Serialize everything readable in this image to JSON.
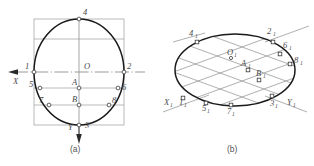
{
  "figure": {
    "colors": {
      "curve": "#1a1a1a",
      "construction": "#9a9a9a",
      "axis": "#7d7d7d",
      "label": "#4a4a4a",
      "background": "#ffffff",
      "marker_fill": "#ffffff"
    }
  },
  "fig_a": {
    "caption": "(a)",
    "axes": [
      {
        "name": "x-axis",
        "label": "X",
        "direction": "left"
      },
      {
        "name": "y-axis",
        "label": "Y",
        "direction": "down"
      }
    ],
    "center_label": "O",
    "points": [
      {
        "id": "p1",
        "label": "1"
      },
      {
        "id": "p2",
        "label": "2"
      },
      {
        "id": "p3",
        "label": "3"
      },
      {
        "id": "p4",
        "label": "4"
      },
      {
        "id": "p5",
        "label": "5"
      },
      {
        "id": "p6",
        "label": "6"
      },
      {
        "id": "p7",
        "label": "7"
      },
      {
        "id": "p8",
        "label": "8"
      },
      {
        "id": "pA",
        "label": "A"
      },
      {
        "id": "pB",
        "label": "B"
      }
    ]
  },
  "fig_b": {
    "caption": "(b)",
    "axes": [
      {
        "name": "x1-axis",
        "label": "X",
        "sub": "1"
      },
      {
        "name": "y1-axis",
        "label": "Y",
        "sub": "1"
      }
    ],
    "center_label": {
      "base": "O",
      "sub": "1"
    },
    "points": [
      {
        "id": "p1_1",
        "base": "1",
        "sub": "1"
      },
      {
        "id": "p2_1",
        "base": "2",
        "sub": "1"
      },
      {
        "id": "p3_1",
        "base": "3",
        "sub": "1"
      },
      {
        "id": "p4_1",
        "base": "4",
        "sub": "1"
      },
      {
        "id": "p5_1",
        "base": "5",
        "sub": "1"
      },
      {
        "id": "p6_1",
        "base": "6",
        "sub": "1"
      },
      {
        "id": "p7_1",
        "base": "7",
        "sub": "1"
      },
      {
        "id": "p8_1",
        "base": "8",
        "sub": "1"
      },
      {
        "id": "pA_1",
        "base": "A",
        "sub": "1"
      },
      {
        "id": "pB_1",
        "base": "B",
        "sub": "1"
      }
    ]
  }
}
